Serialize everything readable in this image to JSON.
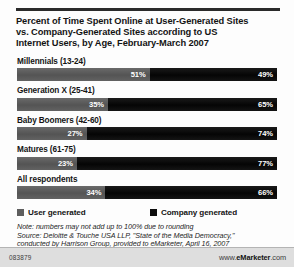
{
  "chart_data": {
    "type": "bar",
    "subtype": "stacked-horizontal-100",
    "title": "Percent of Time Spent Online at User-Generated Sites vs. Company-Generated Sites according to US Internet Users, by Age, February-March 2007",
    "title_lines": [
      "Percent of Time Spent Online at User-Generated Sites",
      "vs. Company-Generated Sites according to US",
      "Internet Users, by Age, February-March 2007"
    ],
    "categories": [
      "Millennials (13-24)",
      "Generation X (25-41)",
      "Baby Boomers (42-60)",
      "Matures (61-75)",
      "All respondents"
    ],
    "series": [
      {
        "name": "User generated",
        "color": "#5e5e5e",
        "values": [
          51,
          35,
          27,
          23,
          34
        ],
        "labels": [
          "51%",
          "35%",
          "27%",
          "23%",
          "34%"
        ]
      },
      {
        "name": "Company generated",
        "color": "#0d0d0d",
        "values": [
          49,
          65,
          74,
          77,
          66
        ],
        "labels": [
          "49%",
          "65%",
          "74%",
          "77%",
          "66%"
        ]
      }
    ],
    "xlabel": "",
    "ylabel": "",
    "xlim": [
      0,
      100
    ],
    "grid": false,
    "legend_position": "bottom",
    "value_suffix": "%"
  },
  "legend": {
    "items": [
      {
        "label": "User generated",
        "color": "#5e5e5e"
      },
      {
        "label": "Company generated",
        "color": "#0d0d0d"
      }
    ]
  },
  "notes": {
    "line1": "Note: numbers may not add up to 100% due to rounding",
    "line2": "Source: Deloitte & Touche USA LLP, \"State of the Media Democracy,\"",
    "line3": "conducted by Harrison Group, provided to eMarketer, April 16, 2007"
  },
  "footer": {
    "id": "083879",
    "url_prefix": "www.",
    "url_brand": "eMarketer",
    "url_suffix": ".com"
  }
}
